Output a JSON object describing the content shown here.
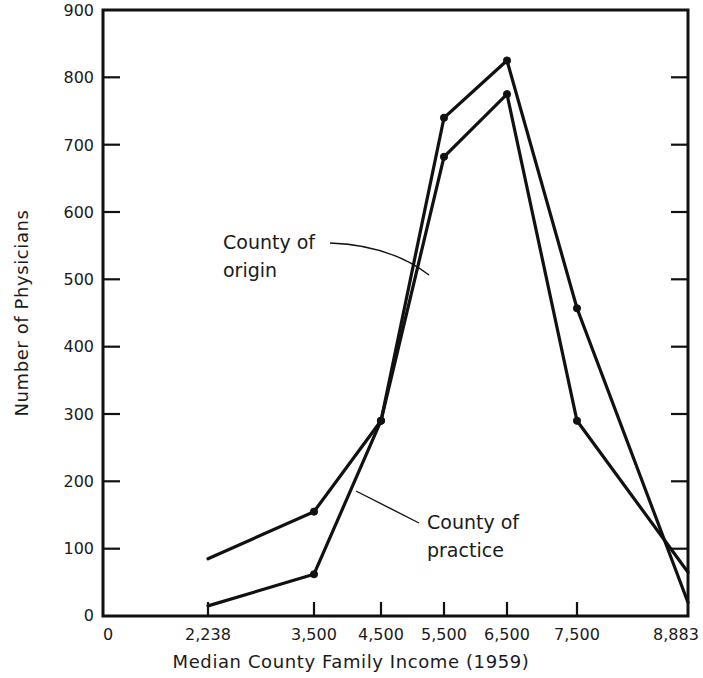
{
  "chart_data": {
    "type": "line",
    "title": "",
    "xlabel": "Median County Family Income  (1959)",
    "ylabel": "Number of Physicians",
    "xlim": [
      0,
      8883
    ],
    "ylim": [
      0,
      900
    ],
    "grid": false,
    "legend_position": "inline-annotations",
    "x_tick_labels": [
      "0",
      "2,238",
      "3,500",
      "4,500",
      "5,500",
      "6,500",
      "7,500",
      "8,883"
    ],
    "x_tick_values": [
      0,
      2238,
      3500,
      4500,
      5500,
      6500,
      7500,
      8883
    ],
    "y_tick_labels": [
      "0",
      "100",
      "200",
      "300",
      "400",
      "500",
      "600",
      "700",
      "800",
      "900"
    ],
    "y_tick_values": [
      0,
      100,
      200,
      300,
      400,
      500,
      600,
      700,
      800,
      900
    ],
    "x": [
      2238,
      3500,
      4500,
      5500,
      6500,
      7500,
      8883
    ],
    "series": [
      {
        "name": "County of origin",
        "values": [
          85,
          155,
          290,
          740,
          825,
          457,
          20
        ]
      },
      {
        "name": "County of practice",
        "values": [
          15,
          62,
          290,
          682,
          775,
          290,
          65
        ]
      }
    ],
    "annotations": [
      {
        "id": "origin",
        "label_line1": "County of",
        "label_line2": "origin"
      },
      {
        "id": "practice",
        "label_line1": "County of",
        "label_line2": "practice"
      }
    ],
    "colors": {
      "line": "#111111",
      "axis": "#111111",
      "background": "#ffffff",
      "text": "#1a1a1a"
    }
  }
}
